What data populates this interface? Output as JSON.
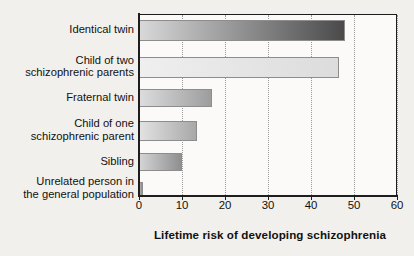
{
  "chart_data": {
    "type": "bar",
    "orientation": "horizontal",
    "title": "",
    "xlabel": "Lifetime risk of developing schizophrenia",
    "ylabel": "",
    "xlim": [
      0,
      60
    ],
    "xticks": [
      0,
      10,
      20,
      30,
      40,
      50,
      60
    ],
    "grid": "vertical-dotted",
    "legend": "none",
    "categories": [
      "Identical twin",
      "Child of two\nschizophrenic parents",
      "Fraternal twin",
      "Child of one\nschizophrenic parent",
      "Sibling",
      "Unrelated person in\nthe general population"
    ],
    "values": [
      48,
      46.5,
      17,
      13.5,
      10,
      1
    ],
    "series": [
      {
        "name": "Lifetime risk (%)",
        "values": [
          48,
          46.5,
          17,
          13.5,
          10,
          1
        ]
      }
    ],
    "bar_fills": [
      {
        "from": "#d8d8d8",
        "to": "#4a4a4a"
      },
      {
        "from": "#efefef",
        "to": "#dcdcdc"
      },
      {
        "from": "#dcdcdc",
        "to": "#9d9d9d"
      },
      {
        "from": "#e2e2e2",
        "to": "#a8a8a8"
      },
      {
        "from": "#d4d4d4",
        "to": "#8f8f8f"
      },
      {
        "from": "#b4b4b4",
        "to": "#8a8a8a"
      }
    ]
  },
  "axis": {
    "tick_labels": [
      "0",
      "10",
      "20",
      "30",
      "40",
      "50",
      "60"
    ],
    "title": "Lifetime risk of developing schizophrenia"
  },
  "colors": {
    "background": "#f2f0ec",
    "plot_background": "#fbfaf8",
    "axis": "#1d1d1d",
    "gridline": "#9a9a9a",
    "text": "#111111"
  }
}
